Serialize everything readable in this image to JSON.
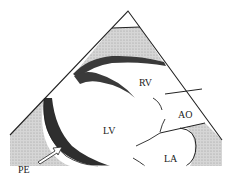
{
  "figure": {
    "type": "echocardiogram-schematic",
    "view": "parasternal long-axis",
    "labels": {
      "rv": "RV",
      "ao": "AO",
      "lv": "LV",
      "la": "LA",
      "pe": "PE"
    },
    "colors": {
      "outline": "#222222",
      "myocardium": "#3a3a3a",
      "stipple": "#c8c8c8",
      "chamber": "#ffffff"
    }
  }
}
